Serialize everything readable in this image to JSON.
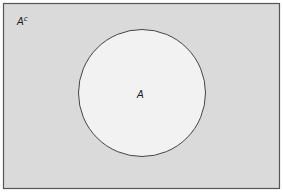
{
  "diagram": {
    "type": "venn",
    "universe": {
      "label": "A",
      "label_superscript": "c",
      "fill": "#dadada",
      "stroke": "#555555"
    },
    "set_a": {
      "label": "A",
      "fill": "#f2f2f2",
      "stroke": "#444444"
    }
  }
}
